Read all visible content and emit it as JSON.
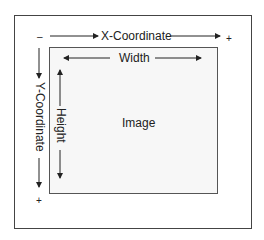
{
  "diagram": {
    "x_axis": {
      "label": "X-Coordinate",
      "start_sign": "–",
      "end_sign": "+"
    },
    "y_axis": {
      "label": "Y-Coordinate",
      "end_sign": "+"
    },
    "image": {
      "label": "Image",
      "width_label": "Width",
      "height_label": "Height"
    }
  }
}
